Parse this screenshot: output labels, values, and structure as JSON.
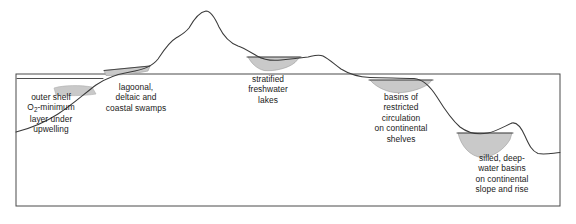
{
  "figure": {
    "width": 576,
    "height": 224,
    "background_color": "#ffffff",
    "line_color": "#3a3a3a",
    "frame_color": "#4a4a4a",
    "deposit_fill_color": "#c9c9c9",
    "deposit_stroke_color": "#8a8a8a",
    "text_color": "#1a1a1a"
  },
  "labels": {
    "outer_shelf": {
      "name": "outer shelf O2-minimum layer under upwelling",
      "lines": [
        "outer shelf",
        "O@SUB2@-minimum",
        "layer under",
        "upwelling"
      ],
      "line1": "outer shelf",
      "line2_pre": "O",
      "line2_sub": "2",
      "line2_post": "-minimum",
      "line3": "layer under",
      "line4": "upwelling"
    },
    "lagoonal": {
      "name": "lagoonal, deltaic and coastal swamps",
      "line1": "lagoonal,",
      "line2": "deltaic and",
      "line3": "coastal swamps"
    },
    "lakes": {
      "name": "stratified freshwater lakes",
      "line1": "stratified",
      "line2": "freshwater",
      "line3": "lakes"
    },
    "shelf_basins": {
      "name": "basins of restricted circulation on continental shelves",
      "line1": "basins of",
      "line2": "restricted",
      "line3": "circulation",
      "line4": "on continental",
      "line5": "shelves"
    },
    "silled_basins": {
      "name": "silled, deep-water basins on continental slope and rise",
      "line1": "silled, deep-",
      "line2": "water basins",
      "line3": "on continental",
      "line4": "slope and rise"
    }
  },
  "diagram": {
    "type": "cross-section-profile",
    "frame": {
      "x": 16,
      "y": 74,
      "width": 544,
      "height": 132
    },
    "terrain_path": "M 16,132 L 40,126 L 62,117 L 78,106 L 92,92 L 104,82 L 116,76 L 128,73 L 142,70 L 154,64 L 163,52 L 170,42 L 177,37 L 183,35 L 189,30 L 195,20 L 201,13 L 206,11 L 212,15 L 218,26 L 224,36 L 230,42 L 236,45 L 242,47 L 249,51 L 256,56 L 263,59 L 272,60 L 281,59 L 290,58 L 298,58 L 306,57 L 313,55 L 319,55 L 325,58 L 331,62 L 339,68 L 348,73 L 356,76 L 368,77 L 384,77 L 400,77 L 414,78 L 424,82 L 434,93 L 442,105 L 450,116 L 458,125 L 466,131 L 476,134 L 486,133 L 495,129 L 503,125 L 511,123 L 518,128 L 524,138 L 528,147 L 532,152 L 538,154 L 546,153 L 554,152 L 560,152",
    "water_lines": [
      {
        "name": "outer-shelf-water-line",
        "x1": 16,
        "y1": 78,
        "x2": 104,
        "y2": 78
      },
      {
        "name": "lagoonal-water-line",
        "x1": 104,
        "y1": 70,
        "x2": 150,
        "y2": 66
      },
      {
        "name": "lake-water-line",
        "x1": 248,
        "y1": 57,
        "x2": 300,
        "y2": 57
      },
      {
        "name": "shelf-basin-water-line",
        "x1": 370,
        "y1": 80,
        "x2": 432,
        "y2": 80
      },
      {
        "name": "silled-basin-water-line",
        "x1": 458,
        "y1": 133,
        "x2": 512,
        "y2": 133
      }
    ],
    "deposits": [
      {
        "name": "outer-shelf-deposit",
        "path": "M 54,88 C 64,85 80,85 92,87 L 96,94 C 84,96 66,96 56,95 Z"
      },
      {
        "name": "lagoonal-deposit",
        "path": "M 104,70 L 150,66 L 148,71 C 136,73 118,75 106,75 Z"
      },
      {
        "name": "lake-deposit",
        "path": "M 248,57 L 300,57 L 295,62 C 288,68 274,71 264,70 C 256,68 251,62 248,57 Z"
      },
      {
        "name": "shelf-basin-deposit",
        "path": "M 370,80 L 432,80 L 428,84 C 418,90 404,93 394,92 C 384,91 375,86 370,80 Z"
      },
      {
        "name": "silled-basin-deposit",
        "path": "M 458,133 L 512,133 L 510,139 C 504,150 492,157 482,157 C 470,156 461,146 458,133 Z"
      }
    ]
  }
}
